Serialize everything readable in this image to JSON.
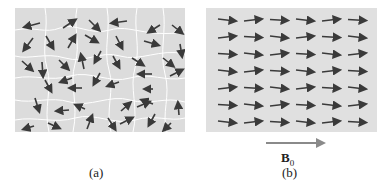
{
  "figure": {
    "panel_a": {
      "label": "(a)",
      "description": "Randomly oriented magnetic domains (no field)",
      "fill_color": "#dcdcdc",
      "boundary_color": "#ffffff",
      "arrow_color": "#3a3a3a"
    },
    "panel_b": {
      "label": "(b)",
      "description": "Domains aligned with applied field",
      "rows": 7,
      "cols": 6,
      "fill_color": "#e0e0e0",
      "arrow_color": "#3a3a3a"
    },
    "field": {
      "symbol": "B",
      "subscript": "0",
      "arrow_color": "#8a8a8a"
    }
  }
}
